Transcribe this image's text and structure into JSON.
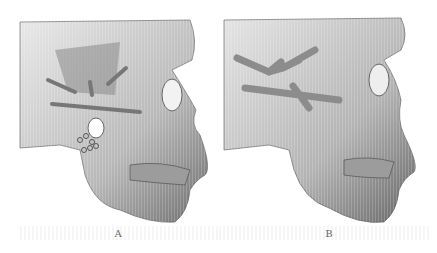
{
  "figure": {
    "panels": [
      {
        "id": "A",
        "label": "A",
        "description": "3D rendering of skull lateral view with fixation plates and shaded surgical planning region"
      },
      {
        "id": "B",
        "label": "B",
        "description": "3D rendering of skull lateral view showing branching bony structure over zygomatic arch"
      }
    ]
  }
}
